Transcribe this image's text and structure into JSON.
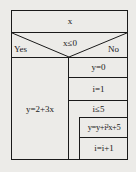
{
  "diagram": {
    "type": "nassi-shneiderman",
    "input": "x",
    "condition": "x≤0",
    "yes_label": "Yes",
    "no_label": "No",
    "yes_branch": [
      "y=2+3x"
    ],
    "no_branch": {
      "init": [
        "y=0",
        "i=1"
      ],
      "loop_condition": "i≤5",
      "loop_body": [
        "y=y+i²x+5",
        "i=i+1"
      ]
    }
  },
  "colors": {
    "line": "#1a1a1a",
    "background": "#ecebe8"
  }
}
